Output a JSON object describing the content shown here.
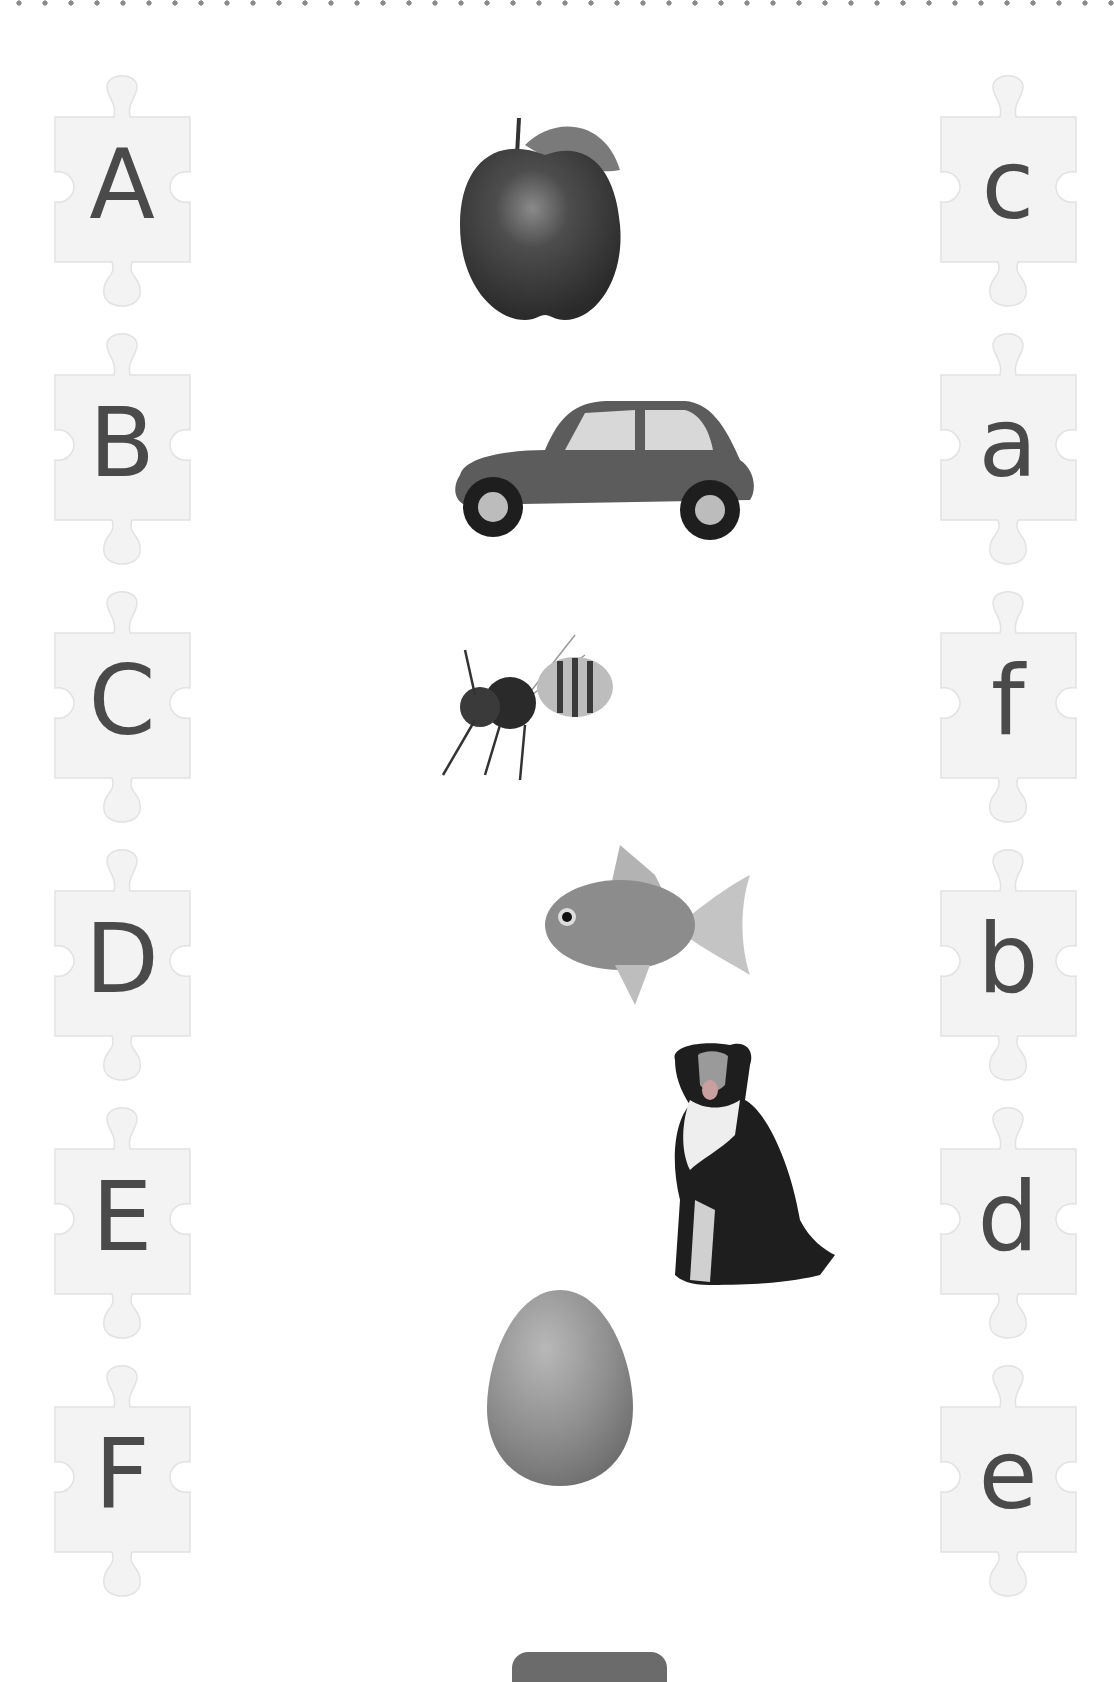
{
  "worksheet": {
    "type": "letter-matching puzzle",
    "left_column": [
      {
        "letter": "A"
      },
      {
        "letter": "B"
      },
      {
        "letter": "C"
      },
      {
        "letter": "D"
      },
      {
        "letter": "E"
      },
      {
        "letter": "F"
      }
    ],
    "pictures": [
      {
        "name": "apple"
      },
      {
        "name": "car"
      },
      {
        "name": "bee"
      },
      {
        "name": "fish"
      },
      {
        "name": "dog"
      },
      {
        "name": "egg"
      }
    ],
    "right_column": [
      {
        "letter": "c"
      },
      {
        "letter": "a"
      },
      {
        "letter": "f"
      },
      {
        "letter": "b"
      },
      {
        "letter": "d"
      },
      {
        "letter": "e"
      }
    ]
  },
  "colors": {
    "letter": "#4a4a4a",
    "piece_fill": "#f3f3f3",
    "piece_edge": "#e2e2e2",
    "cut_line": "#8a8a8a",
    "tab": "#6b6b6b"
  }
}
